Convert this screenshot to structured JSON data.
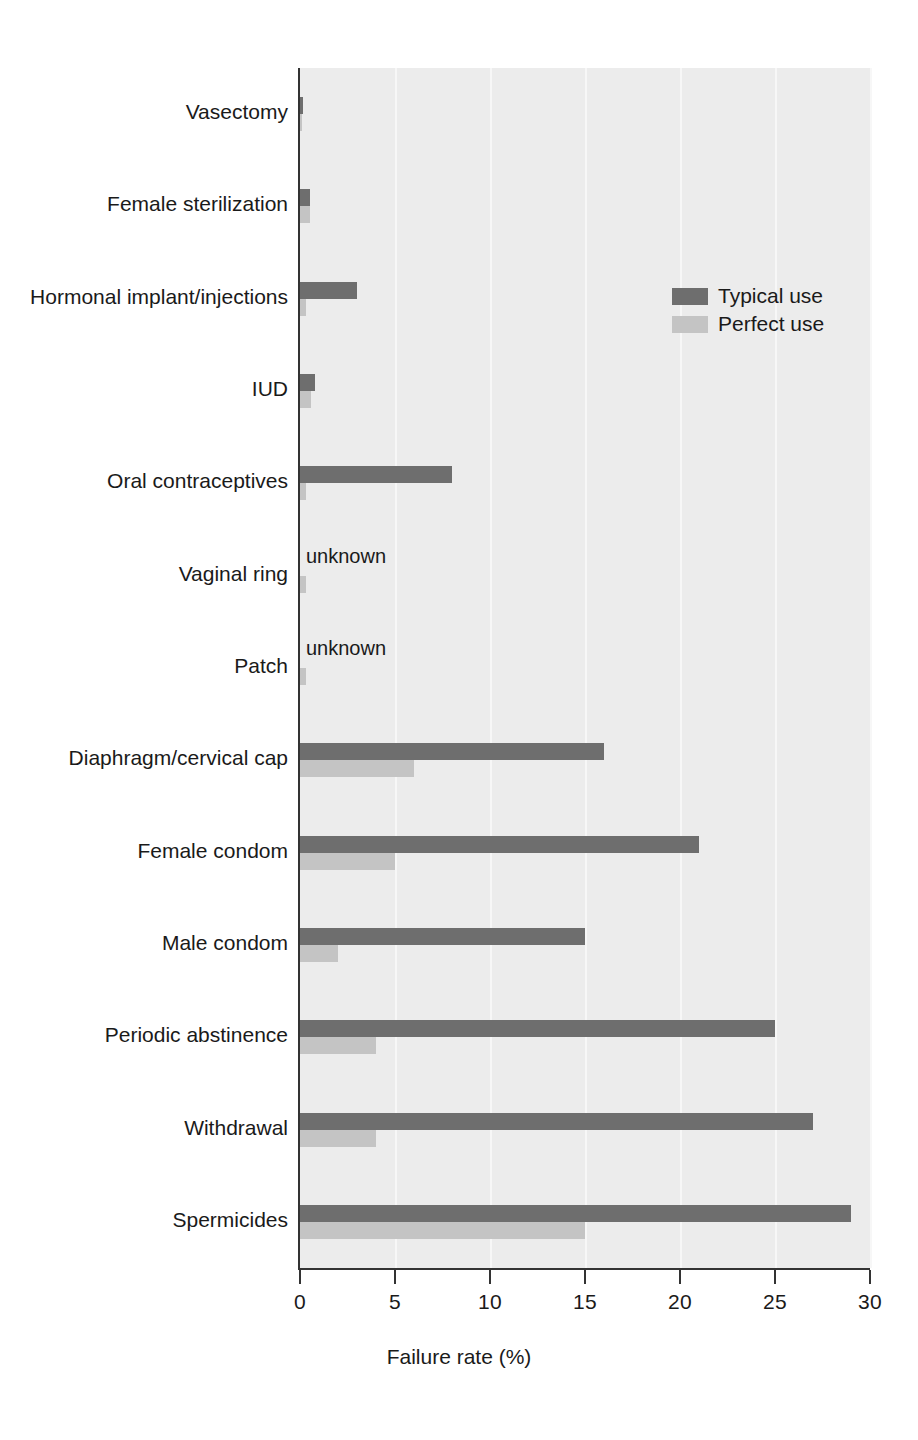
{
  "chart_data": {
    "type": "bar",
    "orientation": "horizontal",
    "title": "",
    "xlabel": "Failure rate (%)",
    "ylabel": "",
    "xlim": [
      0,
      30
    ],
    "xticks": [
      0,
      5,
      10,
      15,
      20,
      25,
      30
    ],
    "xtick_labels": [
      "0",
      "5",
      "10",
      "15",
      "20",
      "25",
      "30"
    ],
    "grid": "vertical",
    "legend_position": "upper right",
    "categories": [
      "Vasectomy",
      "Female sterilization",
      "Hormonal implant/injections",
      "IUD",
      "Oral contraceptives",
      "Vaginal ring",
      "Patch",
      "Diaphragm/cervical cap",
      "Female condom",
      "Male condom",
      "Periodic abstinence",
      "Withdrawal",
      "Spermicides"
    ],
    "series": [
      {
        "name": "Typical use",
        "color": "#6e6e6e",
        "values": [
          0.15,
          0.5,
          3,
          0.8,
          8,
          null,
          null,
          16,
          21,
          15,
          25,
          27,
          29
        ],
        "value_labels": [
          "",
          "",
          "",
          "",
          "",
          "unknown",
          "unknown",
          "",
          "",
          "",
          "",
          "",
          ""
        ]
      },
      {
        "name": "Perfect use",
        "color": "#c4c4c4",
        "values": [
          0.1,
          0.5,
          0.3,
          0.6,
          0.3,
          0.3,
          0.3,
          6,
          5,
          2,
          4,
          4,
          15
        ],
        "value_labels": [
          "",
          "",
          "",
          "",
          "",
          "",
          "",
          "",
          "",
          "",
          "",
          "",
          ""
        ]
      }
    ]
  },
  "legend": {
    "items": [
      {
        "label": "Typical use",
        "color": "#6e6e6e"
      },
      {
        "label": "Perfect use",
        "color": "#c4c4c4"
      }
    ]
  },
  "axis": {
    "x_title": "Failure rate (%)"
  }
}
